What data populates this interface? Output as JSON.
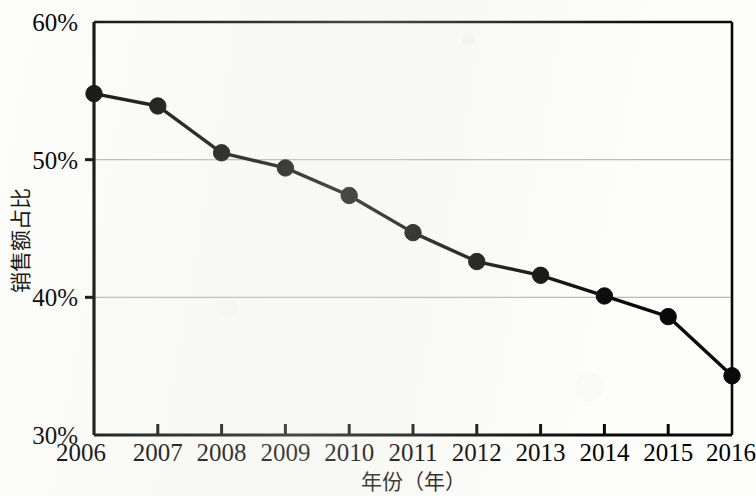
{
  "chart_data": {
    "type": "line",
    "title": "",
    "subtitle": "",
    "xlabel": "年份（年）",
    "ylabel": "销售额占比",
    "categories": [
      2006,
      2007,
      2008,
      2009,
      2010,
      2011,
      2012,
      2013,
      2014,
      2015,
      2016
    ],
    "x_tick_labels": [
      "2006",
      "2007",
      "2008",
      "2009",
      "2010",
      "2011",
      "2012",
      "2013",
      "2014",
      "2015",
      "2016"
    ],
    "y_tick_labels": [
      "30%",
      "40%",
      "50%",
      "60%"
    ],
    "y_ticks": [
      30,
      40,
      50,
      60
    ],
    "ylim": [
      30,
      60
    ],
    "xlim": [
      2006,
      2016
    ],
    "grid": "horizontal-gridlines-at-40-and-50",
    "legend": "none",
    "marker": "filled-circle",
    "series": [
      {
        "name": "销售额占比",
        "values": [
          54.8,
          53.9,
          50.5,
          49.4,
          47.4,
          44.7,
          42.6,
          41.6,
          40.1,
          38.6,
          34.3
        ]
      }
    ],
    "colors": {
      "line": "#0a0a0a",
      "marker": "#0a0a0a",
      "axis": "#0a0a0a",
      "gridline": "#b9b9b9",
      "background": "#fdfdfb"
    }
  }
}
